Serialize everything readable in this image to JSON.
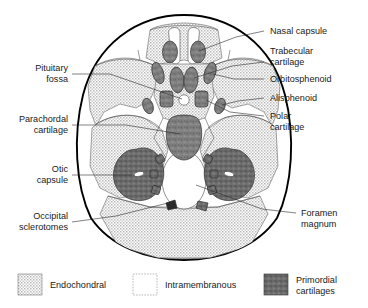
{
  "figure": {
    "colors": {
      "endochondral_fill": "#d9d9d9",
      "intramembranous_fill": "#ffffff",
      "primordial_fill": "#7d7d7d",
      "outline_stroke": "#000000",
      "leader_stroke": "#2b2b2b",
      "text": "#1a1a1a",
      "background": "#ffffff"
    }
  },
  "labels_left": [
    {
      "id": "pituitary-fossa",
      "line1": "Pituitary",
      "line2": "fossa"
    },
    {
      "id": "parachordal-cartilage",
      "line1": "Parachordal",
      "line2": "cartilage"
    },
    {
      "id": "otic-capsule",
      "line1": "Otic",
      "line2": "capsule"
    },
    {
      "id": "occipital-sclerotomes",
      "line1": "Occipital",
      "line2": "sclerotomes"
    }
  ],
  "labels_right": [
    {
      "id": "nasal-capsule",
      "line1": "Nasal capsule",
      "line2": ""
    },
    {
      "id": "trabecular-cartilage",
      "line1": "Trabecular",
      "line2": "cartilage"
    },
    {
      "id": "orbitosphenoid",
      "line1": "Orbitosphenoid",
      "line2": ""
    },
    {
      "id": "alisphenoid",
      "line1": "Alisphenoid",
      "line2": ""
    },
    {
      "id": "polar-cartilage",
      "line1": "Polar",
      "line2": "cartilage"
    },
    {
      "id": "foramen-magnum",
      "line1": "Foramen",
      "line2": "magnum"
    }
  ],
  "legend": [
    {
      "id": "endochondral",
      "line1": "Endochondral",
      "line2": "",
      "swatch": "stippled-gray"
    },
    {
      "id": "intramembranous",
      "line1": "Intramembranous",
      "line2": "",
      "swatch": "white-dashed"
    },
    {
      "id": "primordial-cartilages",
      "line1": "Primordial",
      "line2": "cartilages",
      "swatch": "dark-mottled"
    }
  ]
}
